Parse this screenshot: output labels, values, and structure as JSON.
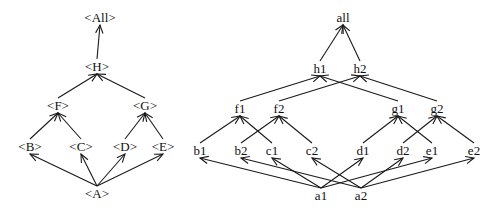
{
  "diagrams": [
    {
      "name": "abstract-lattice",
      "nodes": [
        {
          "id": "All",
          "label": "<All>",
          "x": 100,
          "y": 22
        },
        {
          "id": "H",
          "label": "<H>",
          "x": 97,
          "y": 71
        },
        {
          "id": "F",
          "label": "<F>",
          "x": 58,
          "y": 110
        },
        {
          "id": "G",
          "label": "<G>",
          "x": 145,
          "y": 110
        },
        {
          "id": "B",
          "label": "<B>",
          "x": 30,
          "y": 151
        },
        {
          "id": "C",
          "label": "<C>",
          "x": 81,
          "y": 151
        },
        {
          "id": "D",
          "label": "<D>",
          "x": 125,
          "y": 151
        },
        {
          "id": "E",
          "label": "<E>",
          "x": 163,
          "y": 151
        },
        {
          "id": "A",
          "label": "<A>",
          "x": 97,
          "y": 198
        }
      ],
      "edges": [
        {
          "from": "H",
          "to": "All"
        },
        {
          "from": "F",
          "to": "H"
        },
        {
          "from": "G",
          "to": "H"
        },
        {
          "from": "B",
          "to": "F"
        },
        {
          "from": "C",
          "to": "F"
        },
        {
          "from": "D",
          "to": "G"
        },
        {
          "from": "E",
          "to": "G"
        },
        {
          "from": "A",
          "to": "B"
        },
        {
          "from": "A",
          "to": "C"
        },
        {
          "from": "A",
          "to": "D"
        },
        {
          "from": "A",
          "to": "E"
        }
      ]
    },
    {
      "name": "instance-lattice",
      "nodes": [
        {
          "id": "all",
          "label": "all",
          "x": 343,
          "y": 22
        },
        {
          "id": "h1",
          "label": "h1",
          "x": 320,
          "y": 73
        },
        {
          "id": "h2",
          "label": "h2",
          "x": 360,
          "y": 73
        },
        {
          "id": "f1",
          "label": "f1",
          "x": 240,
          "y": 113
        },
        {
          "id": "f2",
          "label": "f2",
          "x": 279,
          "y": 113
        },
        {
          "id": "g1",
          "label": "g1",
          "x": 398,
          "y": 113
        },
        {
          "id": "g2",
          "label": "g2",
          "x": 437,
          "y": 113
        },
        {
          "id": "b1",
          "label": "b1",
          "x": 200,
          "y": 155
        },
        {
          "id": "b2",
          "label": "b2",
          "x": 241,
          "y": 155
        },
        {
          "id": "c1",
          "label": "c1",
          "x": 272,
          "y": 155
        },
        {
          "id": "c2",
          "label": "c2",
          "x": 312,
          "y": 155
        },
        {
          "id": "d1",
          "label": "d1",
          "x": 363,
          "y": 155
        },
        {
          "id": "d2",
          "label": "d2",
          "x": 403,
          "y": 155
        },
        {
          "id": "e1",
          "label": "e1",
          "x": 432,
          "y": 155
        },
        {
          "id": "e2",
          "label": "e2",
          "x": 474,
          "y": 155
        },
        {
          "id": "a1",
          "label": "a1",
          "x": 321,
          "y": 200
        },
        {
          "id": "a2",
          "label": "a2",
          "x": 361,
          "y": 200
        }
      ],
      "edges": [
        {
          "from": "h1",
          "to": "all"
        },
        {
          "from": "h2",
          "to": "all"
        },
        {
          "from": "f1",
          "to": "h1"
        },
        {
          "from": "g1",
          "to": "h1"
        },
        {
          "from": "f2",
          "to": "h2"
        },
        {
          "from": "g2",
          "to": "h2"
        },
        {
          "from": "b1",
          "to": "f1"
        },
        {
          "from": "c1",
          "to": "f1"
        },
        {
          "from": "b2",
          "to": "f2"
        },
        {
          "from": "c2",
          "to": "f2"
        },
        {
          "from": "d1",
          "to": "g1"
        },
        {
          "from": "e1",
          "to": "g1"
        },
        {
          "from": "d2",
          "to": "g2"
        },
        {
          "from": "e2",
          "to": "g2"
        },
        {
          "from": "a1",
          "to": "b1"
        },
        {
          "from": "a1",
          "to": "c1"
        },
        {
          "from": "a1",
          "to": "d1"
        },
        {
          "from": "a1",
          "to": "e1"
        },
        {
          "from": "a2",
          "to": "b2"
        },
        {
          "from": "a2",
          "to": "c2"
        },
        {
          "from": "a2",
          "to": "d2"
        },
        {
          "from": "a2",
          "to": "e2"
        }
      ]
    }
  ]
}
